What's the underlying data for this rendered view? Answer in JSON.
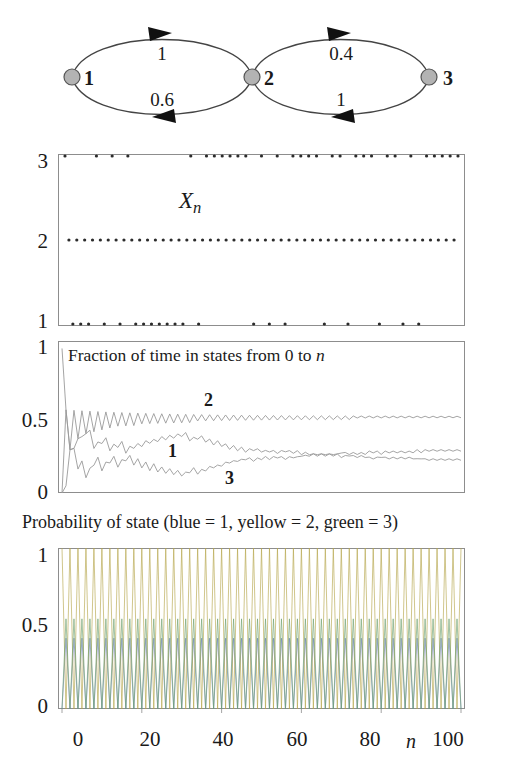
{
  "figure": {
    "title_visible": false,
    "colors": {
      "axis": "#8d8d8d",
      "curve": "#9a9a9a",
      "dot": "#2b2b2b",
      "node_fill": "#b3b3b3",
      "node_stroke": "#555555",
      "text": "#1a1a1a"
    }
  },
  "state_diagram": {
    "name": "markov-chain-state-diagram",
    "nodes": [
      {
        "id": "1",
        "label": "1",
        "cx": 72,
        "cy": 77,
        "r": 8
      },
      {
        "id": "2",
        "label": "2",
        "cx": 252,
        "cy": 77,
        "r": 8
      },
      {
        "id": "3",
        "label": "3",
        "cx": 429,
        "cy": 77,
        "r": 8
      }
    ],
    "edges": [
      {
        "from": "1",
        "to": "2",
        "label": "1",
        "position": "top",
        "lx": 162,
        "ly": 52
      },
      {
        "from": "2",
        "to": "1",
        "label": "0.6",
        "position": "bottom",
        "lx": 162,
        "ly": 98
      },
      {
        "from": "2",
        "to": "3",
        "label": "0.4",
        "position": "top",
        "lx": 341,
        "ly": 52
      },
      {
        "from": "3",
        "to": "2",
        "label": "1",
        "position": "bottom",
        "lx": 341,
        "ly": 98
      }
    ]
  },
  "trajectory_panel": {
    "name": "trajectory-panel",
    "annotation": "X",
    "annotation_sub": "n",
    "y_ticks": [
      "3",
      "2",
      "1"
    ]
  },
  "fraction_panel": {
    "name": "fraction-of-time-panel",
    "caption_parts": [
      "Fraction of time in states from 0 to ",
      "n"
    ],
    "y_ticks": [
      "1",
      "0.5",
      "0"
    ],
    "curve_labels": [
      "2",
      "1",
      "3"
    ]
  },
  "probability_panel": {
    "name": "probability-of-state-panel",
    "caption": "Probability of state (blue = 1, yellow = 2, green = 3)",
    "y_ticks": [
      "1",
      "0.5",
      "0"
    ],
    "x_ticks": [
      "0",
      "20",
      "40",
      "60",
      "80",
      "100"
    ],
    "x_axis_symbol": "n"
  },
  "chart_data": [
    {
      "type": "scatter",
      "name": "trajectory",
      "title": "Xn",
      "xlabel": "n",
      "ylabel": "state",
      "xlim": [
        0,
        100
      ],
      "ylim": [
        1,
        3
      ],
      "yticks": [
        1,
        2,
        3
      ],
      "grid": false,
      "legend": "none",
      "comment": "Sample path X_n of a 3-state Markov chain; state 2 is visited at every odd step (period-2 chain).",
      "x": [
        0,
        1,
        2,
        3,
        4,
        5,
        6,
        7,
        8,
        9,
        10,
        11,
        12,
        13,
        14,
        15,
        16,
        17,
        18,
        19,
        20,
        21,
        22,
        23,
        24,
        25,
        26,
        27,
        28,
        29,
        30,
        31,
        32,
        33,
        34,
        35,
        36,
        37,
        38,
        39,
        40,
        41,
        42,
        43,
        44,
        45,
        46,
        47,
        48,
        49,
        50,
        51,
        52,
        53,
        54,
        55,
        56,
        57,
        58,
        59,
        60,
        61,
        62,
        63,
        64,
        65,
        66,
        67,
        68,
        69,
        70,
        71,
        72,
        73,
        74,
        75,
        76,
        77,
        78,
        79,
        80,
        81,
        82,
        83,
        84,
        85,
        86,
        87,
        88,
        89,
        90,
        91,
        92,
        93,
        94,
        95,
        96,
        97,
        98,
        99,
        100
      ],
      "y": [
        3,
        2,
        1,
        2,
        1,
        2,
        1,
        2,
        3,
        2,
        1,
        2,
        3,
        2,
        1,
        2,
        3,
        2,
        1,
        2,
        1,
        2,
        1,
        2,
        1,
        2,
        1,
        2,
        1,
        2,
        1,
        2,
        3,
        2,
        1,
        2,
        3,
        2,
        3,
        2,
        3,
        2,
        3,
        2,
        3,
        2,
        3,
        2,
        1,
        2,
        3,
        2,
        1,
        2,
        3,
        2,
        1,
        2,
        3,
        2,
        3,
        2,
        3,
        2,
        3,
        2,
        1,
        2,
        3,
        2,
        3,
        2,
        1,
        2,
        3,
        2,
        3,
        2,
        3,
        2,
        1,
        2,
        3,
        2,
        3,
        2,
        1,
        2,
        3,
        2,
        1,
        2,
        3,
        2,
        3,
        2,
        3,
        2,
        3,
        2,
        3
      ]
    },
    {
      "type": "line",
      "name": "fraction-of-time",
      "title": "Fraction of time in states from 0 to n",
      "xlabel": "n",
      "ylabel": "fraction",
      "xlim": [
        0,
        100
      ],
      "ylim": [
        0,
        1
      ],
      "yticks": [
        0,
        0.5,
        1
      ],
      "grid": false,
      "legend": "inline-labels",
      "series": [
        {
          "name": "1",
          "label_xy": [
            22,
            0.28
          ],
          "limit": 0.22,
          "values": [
            0,
            0,
            0.33,
            0.25,
            0.4,
            0.33,
            0.43,
            0.375,
            0.33,
            0.3,
            0.36,
            0.33,
            0.31,
            0.29,
            0.33,
            0.31,
            0.29,
            0.28,
            0.32,
            0.3,
            0.33,
            0.32,
            0.35,
            0.33,
            0.36,
            0.35,
            0.37,
            0.36,
            0.38,
            0.37,
            0.39,
            0.38,
            0.36,
            0.35,
            0.37,
            0.36,
            0.35,
            0.34,
            0.33,
            0.33,
            0.32,
            0.31,
            0.3,
            0.3,
            0.29,
            0.29,
            0.28,
            0.28,
            0.29,
            0.28,
            0.28,
            0.27,
            0.28,
            0.27,
            0.27,
            0.27,
            0.28,
            0.27,
            0.27,
            0.27,
            0.26,
            0.26,
            0.26,
            0.25,
            0.25,
            0.25,
            0.26,
            0.25,
            0.25,
            0.25,
            0.24,
            0.24,
            0.25,
            0.24,
            0.24,
            0.24,
            0.24,
            0.23,
            0.23,
            0.23,
            0.24,
            0.23,
            0.23,
            0.23,
            0.23,
            0.23,
            0.23,
            0.23,
            0.23,
            0.22,
            0.23,
            0.22,
            0.22,
            0.22,
            0.22,
            0.22,
            0.22,
            0.22,
            0.22,
            0.22,
            0.22
          ]
        },
        {
          "name": "2",
          "label_xy": [
            43,
            0.6
          ],
          "limit": 0.5,
          "values": [
            0,
            0.5,
            0.33,
            0.5,
            0.4,
            0.5,
            0.43,
            0.5,
            0.44,
            0.5,
            0.45,
            0.5,
            0.46,
            0.5,
            0.47,
            0.5,
            0.47,
            0.5,
            0.47,
            0.5,
            0.48,
            0.5,
            0.48,
            0.5,
            0.48,
            0.5,
            0.48,
            0.5,
            0.48,
            0.5,
            0.48,
            0.5,
            0.48,
            0.5,
            0.49,
            0.5,
            0.49,
            0.5,
            0.49,
            0.5,
            0.49,
            0.5,
            0.49,
            0.5,
            0.49,
            0.5,
            0.49,
            0.5,
            0.49,
            0.5,
            0.49,
            0.5,
            0.49,
            0.5,
            0.49,
            0.5,
            0.49,
            0.5,
            0.49,
            0.5,
            0.49,
            0.5,
            0.49,
            0.5,
            0.49,
            0.5,
            0.49,
            0.5,
            0.49,
            0.5,
            0.49,
            0.5,
            0.49,
            0.5,
            0.5,
            0.5,
            0.5,
            0.5,
            0.5,
            0.5,
            0.5,
            0.5,
            0.5,
            0.5,
            0.5,
            0.5,
            0.5,
            0.5,
            0.5,
            0.5,
            0.5,
            0.5,
            0.5,
            0.5,
            0.5,
            0.5,
            0.5,
            0.5,
            0.5,
            0.5,
            0.5
          ]
        },
        {
          "name": "3",
          "label_xy": [
            33,
            0.12
          ],
          "limit": 0.28,
          "values": [
            1,
            0.5,
            0.33,
            0.25,
            0.2,
            0.17,
            0.14,
            0.125,
            0.22,
            0.2,
            0.18,
            0.17,
            0.23,
            0.21,
            0.2,
            0.19,
            0.24,
            0.22,
            0.21,
            0.2,
            0.19,
            0.18,
            0.17,
            0.17,
            0.16,
            0.15,
            0.15,
            0.14,
            0.14,
            0.13,
            0.13,
            0.12,
            0.15,
            0.15,
            0.14,
            0.14,
            0.16,
            0.16,
            0.18,
            0.17,
            0.19,
            0.19,
            0.21,
            0.2,
            0.22,
            0.21,
            0.23,
            0.22,
            0.22,
            0.22,
            0.23,
            0.23,
            0.23,
            0.23,
            0.24,
            0.23,
            0.23,
            0.23,
            0.24,
            0.23,
            0.25,
            0.24,
            0.25,
            0.25,
            0.26,
            0.25,
            0.25,
            0.25,
            0.26,
            0.25,
            0.27,
            0.26,
            0.26,
            0.26,
            0.26,
            0.26,
            0.26,
            0.27,
            0.27,
            0.27,
            0.26,
            0.27,
            0.27,
            0.27,
            0.27,
            0.27,
            0.27,
            0.27,
            0.27,
            0.28,
            0.27,
            0.28,
            0.28,
            0.28,
            0.28,
            0.28,
            0.28,
            0.28,
            0.28,
            0.28,
            0.28
          ]
        }
      ]
    },
    {
      "type": "line",
      "name": "probability-of-state",
      "title": "Probability of state (blue = 1, yellow = 2, green = 3)",
      "xlabel": "n",
      "ylabel": "probability",
      "xlim": [
        0,
        100
      ],
      "ylim": [
        0,
        1
      ],
      "yticks": [
        0,
        0.5,
        1
      ],
      "xticks": [
        0,
        20,
        40,
        60,
        80,
        100
      ],
      "grid": false,
      "legend": "in-title",
      "comment": "Period-2 chain: distributions oscillate with period 2 and never converge. Blue (state 1) alternates 0 / 0.44; yellow (state 2) alternates 1 / 0; green (state 3) alternates 0 / 0.56.",
      "series": [
        {
          "name": "blue = 1",
          "color": "#6b7fb5",
          "even_value": 0.0,
          "odd_value": 0.44
        },
        {
          "name": "yellow = 2",
          "color": "#b5a64a",
          "even_value": 1.0,
          "odd_value": 0.0
        },
        {
          "name": "green = 3",
          "color": "#6ea06e",
          "even_value": 0.0,
          "odd_value": 0.56
        }
      ]
    }
  ]
}
